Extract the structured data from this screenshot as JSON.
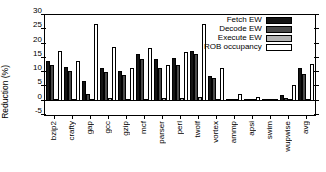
{
  "chart_data": {
    "type": "bar",
    "title": "",
    "xlabel": "",
    "ylabel": "Reduction (%)",
    "ylim": [
      -5,
      30
    ],
    "yticks": [
      -5,
      0,
      5,
      10,
      15,
      20,
      25,
      30
    ],
    "ytick_labels": [
      "-5",
      "0",
      "5",
      "10",
      "15",
      "20",
      "25",
      "30"
    ],
    "grid": false,
    "legend_position": "top-right",
    "categories": [
      "bzip2",
      "crafty",
      "gap",
      "gcc",
      "gzip",
      "mcf",
      "parser",
      "perl",
      "twolf",
      "vortex",
      "ammp",
      "apsi",
      "swim",
      "wupwise",
      "avg"
    ],
    "series": [
      {
        "name": "Fetch EW",
        "color": "#141414",
        "values": [
          14.0,
          11.8,
          7.0,
          11.5,
          10.3,
          16.2,
          14.7,
          15.0,
          17.4,
          8.7,
          0.2,
          0.1,
          0.1,
          1.9,
          11.6
        ]
      },
      {
        "name": "Decode EW",
        "color": "#4a4a4a",
        "values": [
          12.6,
          10.3,
          2.5,
          10.0,
          9.0,
          14.5,
          11.6,
          12.6,
          16.3,
          7.8,
          0.1,
          0.1,
          0.1,
          1.0,
          9.2
        ]
      },
      {
        "name": "Execute EW",
        "color": "#b4b4b4",
        "values": [
          0.3,
          0.3,
          0.2,
          0.9,
          0.6,
          0.5,
          1.1,
          0.9,
          1.4,
          0.2,
          0.0,
          0.0,
          0.0,
          0.1,
          0.5
        ]
      },
      {
        "name": "ROB occupancy",
        "color": "#ffffff",
        "values": [
          17.3,
          13.8,
          26.9,
          18.8,
          11.5,
          18.3,
          12.4,
          17.0,
          27.0,
          11.5,
          2.2,
          1.2,
          0.4,
          5.4,
          13.0
        ]
      }
    ]
  },
  "legend": {
    "entries": [
      {
        "label": "Fetch EW",
        "swatch": "#141414"
      },
      {
        "label": "Decode EW",
        "swatch": "#4a4a4a"
      },
      {
        "label": "Execute EW",
        "swatch": "#b4b4b4"
      },
      {
        "label": "ROB occupancy",
        "swatch": "#ffffff"
      }
    ]
  }
}
